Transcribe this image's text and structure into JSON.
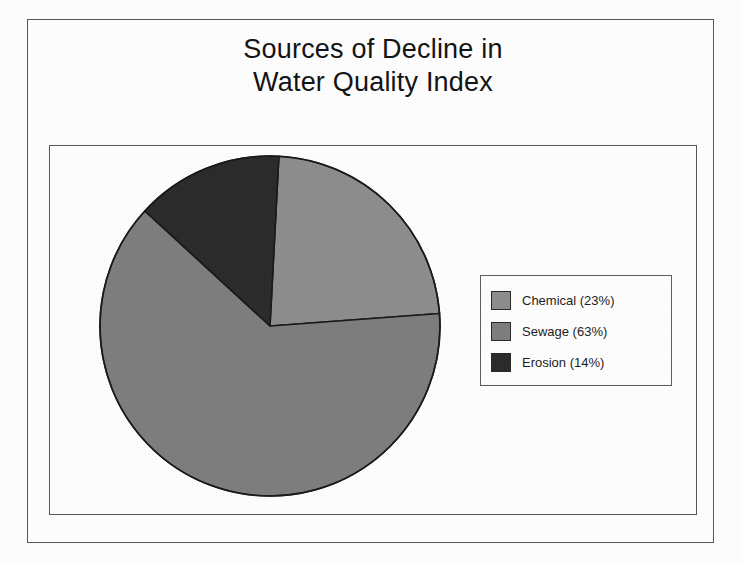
{
  "figure": {
    "title_line_1": "Sources of Decline in",
    "title_line_2": "Water Quality Index"
  },
  "legend": {
    "items": [
      {
        "label": "Chemical (23%)",
        "swatch_name": "legend-swatch-chemical",
        "color": "#8d8d8d"
      },
      {
        "label": "Sewage (63%)",
        "swatch_name": "legend-swatch-sewage",
        "color": "#7e7e7e"
      },
      {
        "label": "Erosion (14%)",
        "swatch_name": "legend-swatch-erosion",
        "color": "#2c2c2c"
      }
    ]
  },
  "colors": {
    "chemical": "#8d8d8d",
    "sewage": "#7e7e7e",
    "erosion": "#2c2c2c",
    "outline": "#1b1b1b",
    "frame": "#555a5e",
    "background": "#fdfdfd"
  },
  "chart_data": {
    "type": "pie",
    "title": "Sources of Decline in Water Quality Index",
    "categories": [
      "Chemical",
      "Sewage",
      "Erosion"
    ],
    "values": [
      23,
      63,
      14
    ],
    "units": "percent",
    "labels": [
      "Chemical (23%)",
      "Sewage (63%)",
      "Erosion (14%)"
    ],
    "colors": [
      "#8d8d8d",
      "#7e7e7e",
      "#2c2c2c"
    ],
    "start_angle_deg": -87,
    "direction": "clockwise",
    "legend_position": "right",
    "grid": false,
    "data_labels_shown": false,
    "geometry": {
      "center_x": 270,
      "center_y": 326,
      "radius": 170
    }
  }
}
